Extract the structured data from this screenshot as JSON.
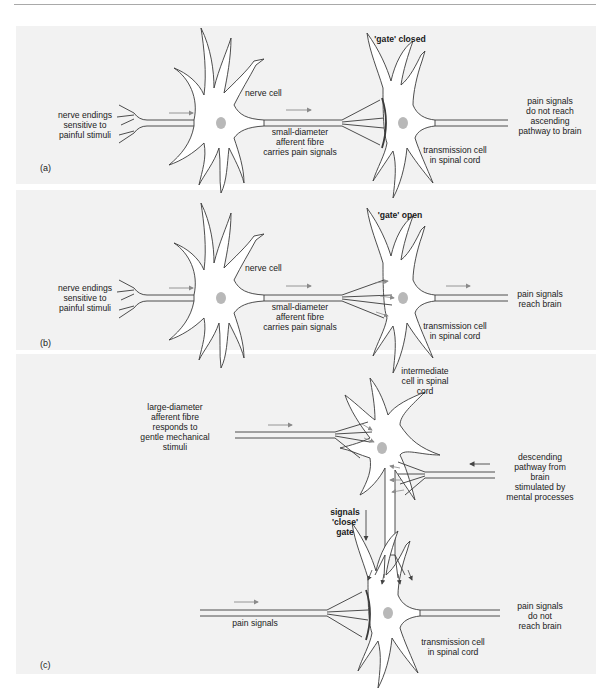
{
  "figure": {
    "panels": [
      {
        "id": "a",
        "tag": "(a)",
        "state_title": "'gate' closed",
        "labels": {
          "input": "nerve endings\nsensitive to\npainful stimuli",
          "nerve_cell": "nerve cell",
          "fibre": "small-diameter\nafferent fibre\ncarries pain signals",
          "transmission_cell": "transmission cell\nin spinal cord",
          "output": "pain signals\ndo not reach\nascending\npathway to brain"
        }
      },
      {
        "id": "b",
        "tag": "(b)",
        "state_title": "'gate' open",
        "labels": {
          "input": "nerve endings\nsensitive to\npainful stimuli",
          "nerve_cell": "nerve cell",
          "fibre": "small-diameter\nafferent fibre\ncarries pain signals",
          "transmission_cell": "transmission cell\nin spinal cord",
          "output": "pain signals\nreach brain"
        }
      },
      {
        "id": "c",
        "tag": "(c)",
        "labels": {
          "intermediate_cell": "intermediate\ncell in spinal\ncord",
          "large_fibre": "large-diameter\nafferent fibre\nresponds to\ngentle mechanical\nstimuli",
          "descending": "descending\npathway from\nbrain\nstimulated by\nmental processes",
          "signals_close": "signals\n'close'\ngate",
          "pain_signals": "pain signals",
          "transmission_cell": "transmission cell\nin spinal cord",
          "output": "pain signals\ndo not\nreach brain"
        }
      }
    ],
    "caption_fragment": "...the gate... (truncated caption text below figure)"
  },
  "colors": {
    "panel_bg": "#f2f2f2",
    "line": "#3a3a3a",
    "arrow": "#8a8a8a",
    "nucleus": "#b8b8b8",
    "cell_fill": "#ffffff"
  }
}
